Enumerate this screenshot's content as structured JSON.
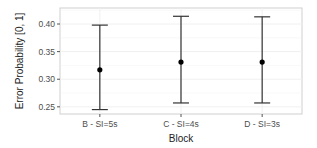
{
  "chart_data": {
    "type": "errorbar",
    "title": "",
    "xlabel": "Block",
    "ylabel": "Error Probability [0, 1]",
    "categories": [
      "B - SI=5s",
      "C - SI=4s",
      "D - SI=3s"
    ],
    "values": [
      0.317,
      0.331,
      0.331
    ],
    "lower": [
      0.245,
      0.257,
      0.257
    ],
    "upper": [
      0.398,
      0.414,
      0.413
    ],
    "yticks": [
      0.25,
      0.3,
      0.35,
      0.4
    ],
    "ytick_labels": [
      "0.25",
      "0.30",
      "0.35",
      "0.40"
    ],
    "ylim": [
      0.237,
      0.429
    ],
    "grid": true,
    "legend": "none"
  },
  "colors": {
    "panel_border": "#cfcfcf",
    "grid": "#f0f0f0",
    "errorbar": "#333333",
    "point": "#000000",
    "axis_text": "#4d4d4d",
    "axis_title": "#222222"
  }
}
